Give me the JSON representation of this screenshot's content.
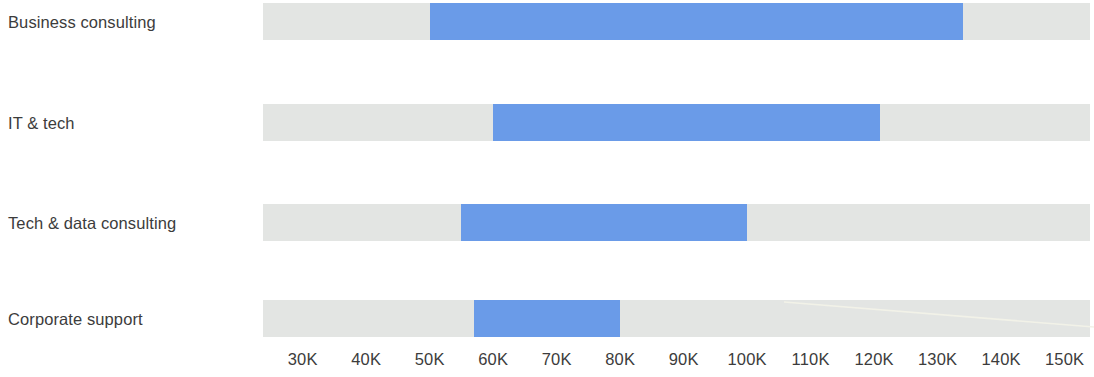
{
  "chart_data": {
    "type": "bar",
    "subtype": "range-bar",
    "title": "",
    "subtitle": "",
    "xlabel": "",
    "ylabel": "",
    "orientation": "horizontal",
    "grid": false,
    "legend": null,
    "xlim": [
      23750,
      154000
    ],
    "axis_tick_labels": [
      "30K",
      "40K",
      "50K",
      "60K",
      "70K",
      "80K",
      "90K",
      "100K",
      "110K",
      "120K",
      "130K",
      "140K",
      "150K"
    ],
    "axis_tick_values": [
      30000,
      40000,
      50000,
      60000,
      70000,
      80000,
      90000,
      100000,
      110000,
      120000,
      130000,
      140000,
      150000
    ],
    "categories": [
      "Business consulting",
      "IT & tech",
      "Tech & data consulting",
      "Corporate support"
    ],
    "series": [
      {
        "name": "range",
        "low": [
          50000,
          60000,
          55000,
          57000
        ],
        "high": [
          134000,
          121000,
          100000,
          80000
        ]
      }
    ],
    "track_color": "#e3e5e3",
    "bar_color": "#6a9be8",
    "label_color": "#3c3c3c",
    "background_color": "#ffffff"
  },
  "rows": [
    {
      "label": "Business consulting",
      "low": 50000,
      "high": 134000,
      "low_label": "50K",
      "high_label": "134K"
    },
    {
      "label": "IT & tech",
      "low": 60000,
      "high": 121000,
      "low_label": "60K",
      "high_label": "121K"
    },
    {
      "label": "Tech & data consulting",
      "low": 55000,
      "high": 100000,
      "low_label": "55K",
      "high_label": "100K"
    },
    {
      "label": "Corporate support",
      "low": 57000,
      "high": 80000,
      "low_label": "57K",
      "high_label": "80K"
    }
  ],
  "axis": {
    "ticks": [
      "30K",
      "40K",
      "50K",
      "60K",
      "70K",
      "80K",
      "90K",
      "100K",
      "110K",
      "120K",
      "130K",
      "140K",
      "150K"
    ]
  }
}
